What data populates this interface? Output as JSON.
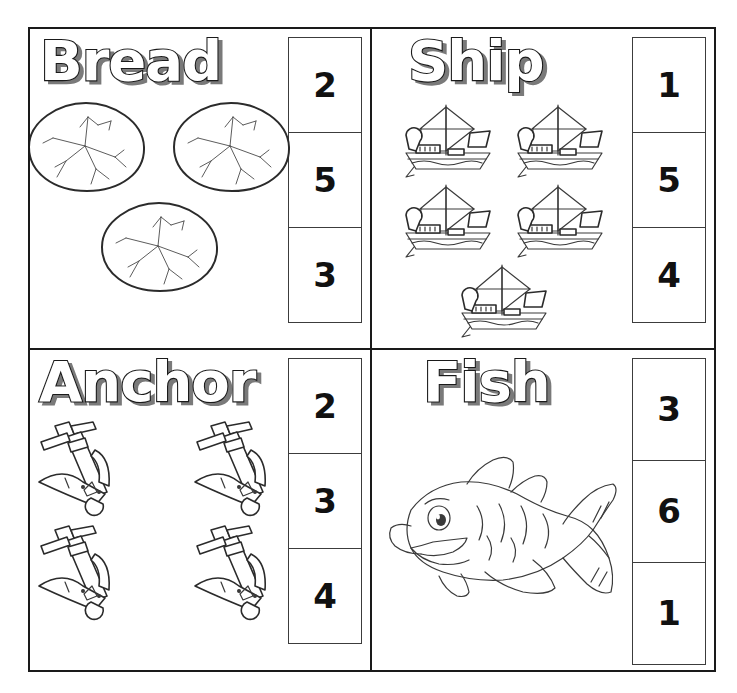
{
  "worksheet": {
    "panels": [
      {
        "id": "bread",
        "title": "Bread",
        "object_icon": "bread-icon",
        "object_count": 3,
        "choices": [
          "2",
          "5",
          "3"
        ]
      },
      {
        "id": "ship",
        "title": "Ship",
        "object_icon": "ship-icon",
        "object_count": 5,
        "choices": [
          "1",
          "5",
          "4"
        ]
      },
      {
        "id": "anchor",
        "title": "Anchor",
        "object_icon": "anchor-icon",
        "object_count": 4,
        "choices": [
          "2",
          "3",
          "4"
        ]
      },
      {
        "id": "fish",
        "title": "Fish",
        "object_icon": "fish-icon",
        "object_count": 1,
        "choices": [
          "3",
          "6",
          "1"
        ]
      }
    ],
    "colors": {
      "ink": "#2b2b2b",
      "border": "#1a1a1a",
      "paper": "#ffffff",
      "numeral": "#111111",
      "title_shadow": "#7a7a7a"
    }
  }
}
